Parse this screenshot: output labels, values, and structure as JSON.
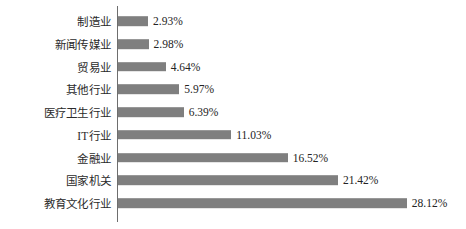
{
  "chart_data": {
    "type": "bar",
    "orientation": "horizontal",
    "title": "",
    "xlabel": "",
    "ylabel": "",
    "grid": false,
    "legend": null,
    "xlim": [
      0,
      28.12
    ],
    "value_suffix": "%",
    "categories": [
      "制造业",
      "新闻传媒业",
      "贸易业",
      "其他行业",
      "医疗卫生行业",
      "IT行业",
      "金融业",
      "国家机关",
      "教育文化行业"
    ],
    "values": [
      2.93,
      2.98,
      4.64,
      5.97,
      6.39,
      11.03,
      16.52,
      21.42,
      28.12
    ],
    "value_labels": [
      "2.93%",
      "2.98%",
      "4.64%",
      "5.97%",
      "6.39%",
      "11.03%",
      "16.52%",
      "21.42%",
      "28.12%"
    ],
    "colors": {
      "bar": "#7f7f7f",
      "axis": "#6e6e6e",
      "text": "#232323",
      "background": "#ffffff"
    }
  }
}
